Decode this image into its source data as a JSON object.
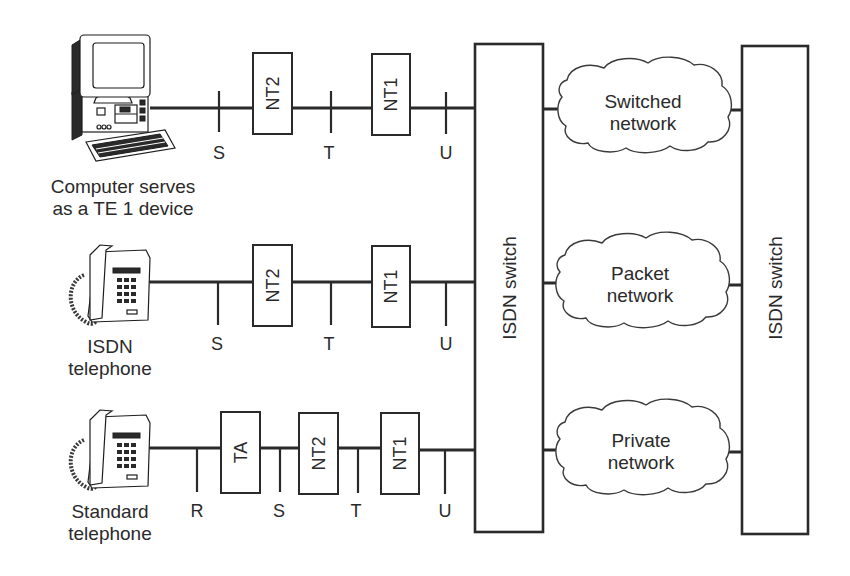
{
  "diagram": {
    "type": "ISDN reference architecture",
    "rows": [
      {
        "device": {
          "name": "computer",
          "label_lines": [
            "Computer serves",
            "as a TE 1 device"
          ]
        },
        "components": [
          "NT2",
          "NT1"
        ],
        "reference_points": [
          "S",
          "T",
          "U"
        ],
        "network": {
          "label_lines": [
            "Switched",
            "network"
          ]
        }
      },
      {
        "device": {
          "name": "isdn-telephone",
          "label_lines": [
            "ISDN",
            "telephone"
          ]
        },
        "components": [
          "NT2",
          "NT1"
        ],
        "reference_points": [
          "S",
          "T",
          "U"
        ],
        "network": {
          "label_lines": [
            "Packet",
            "network"
          ]
        }
      },
      {
        "device": {
          "name": "standard-telephone",
          "label_lines": [
            "Standard",
            "telephone"
          ]
        },
        "components": [
          "TA",
          "NT2",
          "NT1"
        ],
        "reference_points": [
          "R",
          "S",
          "T",
          "U"
        ],
        "network": {
          "label_lines": [
            "Private",
            "network"
          ]
        }
      }
    ],
    "switches": [
      {
        "label": "ISDN switch"
      },
      {
        "label": "ISDN switch"
      }
    ],
    "colors": {
      "ink": "#2a2a2a",
      "background": "#ffffff"
    }
  }
}
